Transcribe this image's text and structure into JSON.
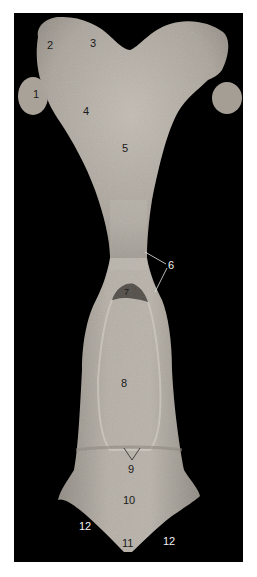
{
  "figure": {
    "background_color": "#000000",
    "specimen_color": "#b3ada4",
    "labels": [
      {
        "id": "1",
        "text": "1",
        "x": 33,
        "y": 89,
        "tone": "dark"
      },
      {
        "id": "2",
        "text": "2",
        "x": 47,
        "y": 40,
        "tone": "dark"
      },
      {
        "id": "3",
        "text": "3",
        "x": 90,
        "y": 38,
        "tone": "dark"
      },
      {
        "id": "4",
        "text": "4",
        "x": 83,
        "y": 106,
        "tone": "dark"
      },
      {
        "id": "5",
        "text": "5",
        "x": 122,
        "y": 143,
        "tone": "dark"
      },
      {
        "id": "6",
        "text": "6",
        "x": 168,
        "y": 260,
        "tone": "light"
      },
      {
        "id": "7",
        "text": "7",
        "x": 124,
        "y": 287,
        "tone": "dark"
      },
      {
        "id": "8",
        "text": "8",
        "x": 121,
        "y": 378,
        "tone": "dark"
      },
      {
        "id": "9",
        "text": "9",
        "x": 128,
        "y": 464,
        "tone": "dark"
      },
      {
        "id": "10",
        "text": "10",
        "x": 123,
        "y": 495,
        "tone": "dark"
      },
      {
        "id": "11",
        "text": "11",
        "x": 122,
        "y": 538,
        "tone": "dark"
      },
      {
        "id": "12a",
        "text": "12",
        "x": 79,
        "y": 521,
        "tone": "light"
      },
      {
        "id": "12b",
        "text": "12",
        "x": 163,
        "y": 536,
        "tone": "light"
      }
    ]
  }
}
